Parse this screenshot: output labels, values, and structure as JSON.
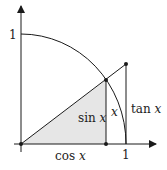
{
  "diagram": {
    "type": "unit-circle-trig-inequality",
    "labels": {
      "y_one": "1",
      "x_one": "1",
      "sin_fn": "sin",
      "cos_fn": "cos",
      "tan_fn": "tan",
      "var": "x",
      "arc_label": "x"
    },
    "colors": {
      "line": "#1a1a1a",
      "fill": "#e6e6e6",
      "background": "#ffffff"
    }
  }
}
